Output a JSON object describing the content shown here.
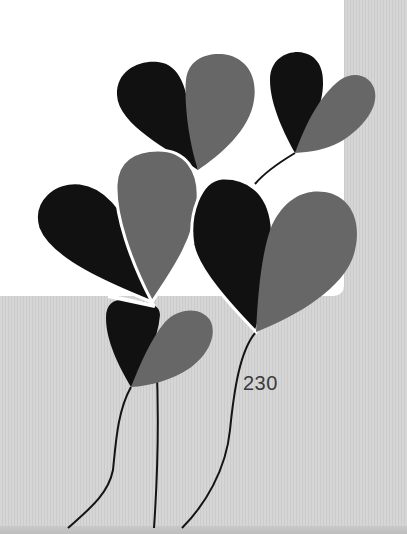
{
  "scene": {
    "description": "Photo of a card with heart-shaped balloon artwork on a gray striped surface",
    "label": "230",
    "colors": {
      "card": "#ffffff",
      "background": "#d3d3d3",
      "balloon_dark": "#111111",
      "balloon_gray": "#676767",
      "string": "#141414",
      "label_text": "#3a3a3a"
    },
    "balloons": [
      {
        "name": "top-center",
        "tip": [
          198,
          170
        ]
      },
      {
        "name": "top-right",
        "tip": [
          295,
          153
        ]
      },
      {
        "name": "middle-left",
        "tip": [
          152,
          302
        ]
      },
      {
        "name": "middle-right",
        "tip": [
          256,
          332
        ]
      },
      {
        "name": "lower-center",
        "tip": [
          131,
          387
        ]
      }
    ]
  }
}
